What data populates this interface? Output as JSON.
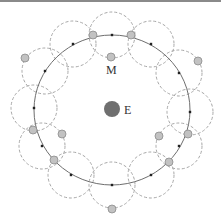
{
  "diagram": {
    "labels": {
      "earth": "E",
      "moon": "M"
    },
    "colors": {
      "orbit": "#6e6e6e",
      "epicycle": "#a8a8a8",
      "earth": "#6f6f6f",
      "moon_fill": "#c2c2c2",
      "moon_stroke": "#8c8c8c",
      "deferent_point": "#222222"
    },
    "deferent": {
      "cx": 112,
      "cy": 110,
      "rx": 78,
      "ry": 75
    },
    "earth": {
      "cx": 112,
      "cy": 109,
      "r": 8
    },
    "epicycle_radius": 23,
    "deferent_points": [
      {
        "x": 112,
        "y": 35
      },
      {
        "x": 151,
        "y": 44
      },
      {
        "x": 179,
        "y": 73
      },
      {
        "x": 190,
        "y": 112
      },
      {
        "x": 179,
        "y": 146
      },
      {
        "x": 151,
        "y": 175
      },
      {
        "x": 112,
        "y": 185
      },
      {
        "x": 71,
        "y": 175
      },
      {
        "x": 42,
        "y": 146
      },
      {
        "x": 34,
        "y": 108
      },
      {
        "x": 45,
        "y": 71
      },
      {
        "x": 73,
        "y": 44
      }
    ],
    "moons": [
      {
        "x": 111,
        "y": 57
      },
      {
        "x": 131,
        "y": 35
      },
      {
        "x": 198,
        "y": 61
      },
      {
        "x": 188,
        "y": 134
      },
      {
        "x": 159,
        "y": 136
      },
      {
        "x": 169,
        "y": 162
      },
      {
        "x": 112,
        "y": 209
      },
      {
        "x": 54,
        "y": 160
      },
      {
        "x": 62,
        "y": 134
      },
      {
        "x": 33,
        "y": 130
      },
      {
        "x": 25,
        "y": 58
      },
      {
        "x": 93,
        "y": 35
      }
    ]
  }
}
